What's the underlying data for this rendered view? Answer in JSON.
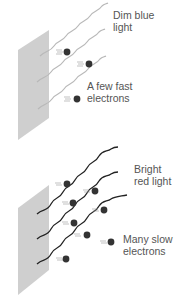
{
  "panels": [
    {
      "id": "dim-blue",
      "label_line1": "Dim blue",
      "label_line2": "light",
      "electrons_label_line1": "A few fast",
      "electrons_label_line2": "electrons",
      "wave_color": "#b8b8b8",
      "electron_count": 3
    },
    {
      "id": "bright-red",
      "label_line1": "Bright",
      "label_line2": "red light",
      "electrons_label_line1": "Many slow",
      "electrons_label_line2": "electrons",
      "wave_color": "#222222",
      "electron_count": 8
    }
  ],
  "colors": {
    "plate": "#cfcfcf",
    "electron": "#333333",
    "text": "#555555"
  }
}
